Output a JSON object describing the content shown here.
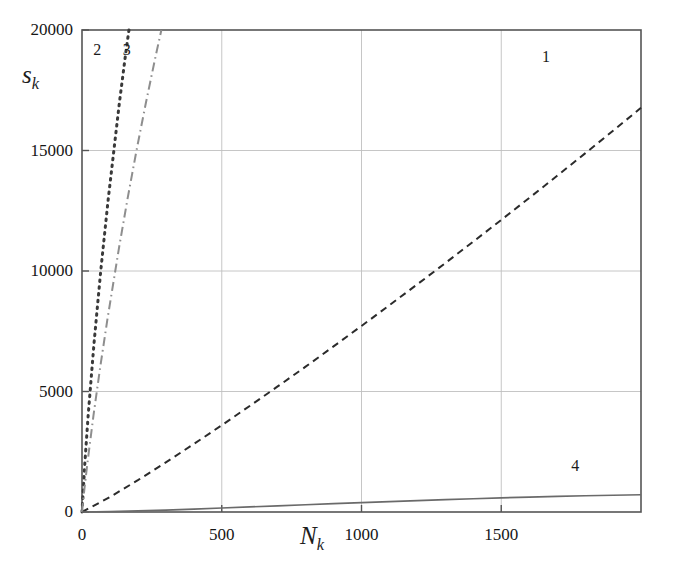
{
  "figure": {
    "background_color": "#ffffff",
    "frame_color": "#555555",
    "grid_color": "#bfbfbf"
  },
  "chart_data": {
    "type": "line",
    "title": "",
    "subtitle": "",
    "xlabel": "N_k",
    "ylabel": "s_k",
    "xlabel_display": "N",
    "xlabel_sub": "k",
    "ylabel_display": "s",
    "ylabel_sub": "k",
    "xlim": [
      0,
      2000
    ],
    "ylim": [
      0,
      20000
    ],
    "xticks": [
      0,
      500,
      1000,
      1500
    ],
    "xtick_labels": [
      "0",
      "500",
      "1000",
      "1500"
    ],
    "yticks": [
      0,
      5000,
      10000,
      15000,
      20000
    ],
    "ytick_labels": [
      "0",
      "5000",
      "10000",
      "15000",
      "20000"
    ],
    "grid": true,
    "grid_style": "solid light gray",
    "legend": "inline curve numbers",
    "legend_position": "inline",
    "series": [
      {
        "name": "1",
        "label": "1",
        "style": "dashed",
        "color": "#2b2b2b",
        "x": [
          0,
          100,
          200,
          300,
          400,
          500,
          600,
          700,
          800,
          900,
          1000,
          1100,
          1200,
          1300,
          1400,
          1500,
          1600,
          1700,
          1800,
          1900,
          2000
        ],
        "y": [
          0,
          620,
          1320,
          2060,
          2820,
          3600,
          4400,
          5210,
          6030,
          6870,
          7720,
          8580,
          9450,
          10330,
          11220,
          12120,
          13030,
          13950,
          14880,
          15820,
          16770
        ]
      },
      {
        "name": "2",
        "label": "2",
        "style": "dotted",
        "color": "#3a3a3a",
        "x": [
          0,
          5,
          10,
          16,
          22,
          29,
          36,
          43,
          51,
          59,
          67,
          76,
          85,
          94,
          104,
          114,
          124,
          134,
          145,
          156,
          168
        ],
        "y": [
          0,
          1000,
          2000,
          3000,
          4000,
          5000,
          6000,
          7000,
          8000,
          9000,
          10000,
          11000,
          12000,
          13000,
          14000,
          15000,
          16000,
          17000,
          18000,
          19000,
          20000
        ]
      },
      {
        "name": "3",
        "label": "3",
        "style": "dash-dot",
        "color": "#8e8e8e",
        "x": [
          0,
          9,
          19,
          30,
          41,
          53,
          65,
          78,
          91,
          105,
          119,
          133,
          148,
          163,
          179,
          195,
          212,
          229,
          247,
          265,
          284
        ],
        "y": [
          0,
          1000,
          2000,
          3000,
          4000,
          5000,
          6000,
          7000,
          8000,
          9000,
          10000,
          11000,
          12000,
          13000,
          14000,
          15000,
          16000,
          17000,
          18000,
          19000,
          20000
        ]
      },
      {
        "name": "4",
        "label": "4",
        "style": "solid",
        "color": "#6a6a6a",
        "x": [
          0,
          100,
          200,
          300,
          400,
          500,
          600,
          700,
          800,
          900,
          1000,
          1100,
          1200,
          1300,
          1400,
          1500,
          1600,
          1700,
          1800,
          1900,
          2000
        ],
        "y": [
          0,
          20,
          45,
          80,
          120,
          165,
          210,
          255,
          300,
          345,
          390,
          430,
          470,
          510,
          550,
          585,
          620,
          650,
          675,
          695,
          715
        ]
      }
    ],
    "annotations": [
      {
        "text": "1",
        "x": 1660,
        "y": 18900
      },
      {
        "text": "2",
        "x": 55,
        "y": 19150
      },
      {
        "text": "3",
        "x": 160,
        "y": 19150
      },
      {
        "text": "4",
        "x": 1765,
        "y": 1900
      }
    ]
  }
}
